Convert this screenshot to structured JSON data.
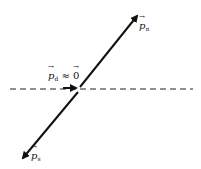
{
  "diagram": {
    "type": "vector diagram",
    "colors": {
      "line": "#111111",
      "background": "#ffffff"
    },
    "labels": {
      "p_n": {
        "symbol": "p",
        "subscript": "n"
      },
      "p_d": {
        "symbol": "p",
        "subscript": "d",
        "relation": "≈",
        "rhs": "0"
      },
      "p_s": {
        "symbol": "p",
        "subscript": "s"
      }
    },
    "elements": [
      {
        "name": "dashed-axis",
        "style": "dashed horizontal line"
      },
      {
        "name": "vector-p-n",
        "direction": "up-right"
      },
      {
        "name": "vector-p-s",
        "direction": "down-left"
      },
      {
        "name": "vector-p-d",
        "direction": "right",
        "note": "small"
      }
    ]
  }
}
